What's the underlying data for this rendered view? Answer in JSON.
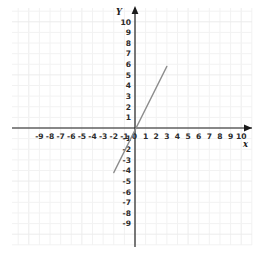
{
  "figure": {
    "kind": "coordinate-plane-line-graph",
    "background_color": "#ffffff",
    "width": 265,
    "height": 263
  },
  "axes": {
    "x_axis_label": "x",
    "y_axis_label": "Y",
    "x_tick_labels": [
      "-9",
      "-8",
      "-7",
      "-6",
      "-5",
      "-4",
      "-3",
      "-2",
      "-1",
      "0",
      "1",
      "2",
      "3",
      "4",
      "5",
      "6",
      "7",
      "8",
      "9",
      "10"
    ],
    "y_tick_labels_positive": [
      "10",
      "9",
      "8",
      "7",
      "6",
      "5",
      "4",
      "3",
      "2",
      "1"
    ],
    "y_tick_labels_negative": [
      "-1",
      "-2",
      "-3",
      "-4",
      "-5",
      "-6",
      "-7",
      "-8",
      "-9"
    ],
    "origin_label": "0",
    "axis_color": "#1a1a1a",
    "grid_color": "#f2f2f2",
    "tick_label_color": "#2b2b2b"
  },
  "chart_data": {
    "type": "line",
    "title": "",
    "xlabel": "x",
    "ylabel": "Y",
    "xlim": [
      -9.8,
      10.6
    ],
    "ylim": [
      -9.8,
      10.6
    ],
    "xticks": [
      -9,
      -8,
      -7,
      -6,
      -5,
      -4,
      -3,
      -2,
      -1,
      0,
      1,
      2,
      3,
      4,
      5,
      6,
      7,
      8,
      9,
      10
    ],
    "yticks": [
      -9,
      -8,
      -7,
      -6,
      -5,
      -4,
      -3,
      -2,
      -1,
      1,
      2,
      3,
      4,
      5,
      6,
      7,
      8,
      9,
      10
    ],
    "grid": true,
    "legend": null,
    "series": [
      {
        "name": "line-segment",
        "color": "#8d8d8d",
        "slope": 2,
        "y_intercept": -1.2,
        "x_intercept": 0.6,
        "equation": "y = 2x - 1.2",
        "x": [
          -2,
          3
        ],
        "values": [
          -4.2,
          5.8
        ],
        "points": [
          [
            -2,
            -4.2
          ],
          [
            3,
            5.8
          ]
        ]
      }
    ]
  }
}
